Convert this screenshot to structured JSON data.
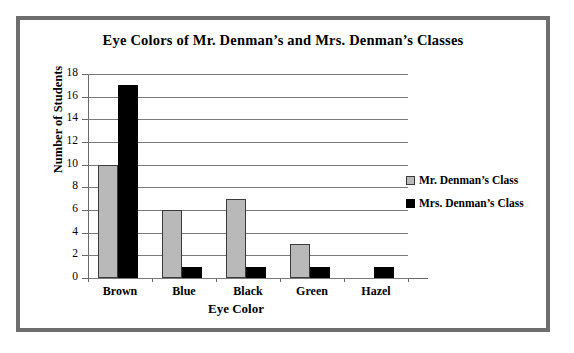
{
  "chart_data": {
    "type": "bar",
    "title": "Eye Colors of Mr. Denman’s and Mrs. Denman’s Classes",
    "xlabel": "Eye Color",
    "ylabel": "Number of Students",
    "categories": [
      "Brown",
      "Blue",
      "Black",
      "Green",
      "Hazel"
    ],
    "series": [
      {
        "name": "Mr. Denman’s Class",
        "color": "#b9b9b9",
        "values": [
          10,
          6,
          7,
          3,
          0
        ]
      },
      {
        "name": "Mrs. Denman’s Class",
        "color": "#000000",
        "values": [
          17,
          1,
          1,
          1,
          1
        ]
      }
    ],
    "ylim": [
      0,
      18
    ],
    "ytick_labels": [
      "18",
      "16",
      "14",
      "12",
      "10",
      "8",
      "6",
      "4",
      "2",
      "0"
    ],
    "ytick_values": [
      18,
      16,
      14,
      12,
      10,
      8,
      6,
      4,
      2,
      0
    ],
    "ystep": 2,
    "grid": true,
    "legend_position": "right"
  },
  "frame": {
    "border_color": "#6e6e6e",
    "background": "#ffffff"
  }
}
